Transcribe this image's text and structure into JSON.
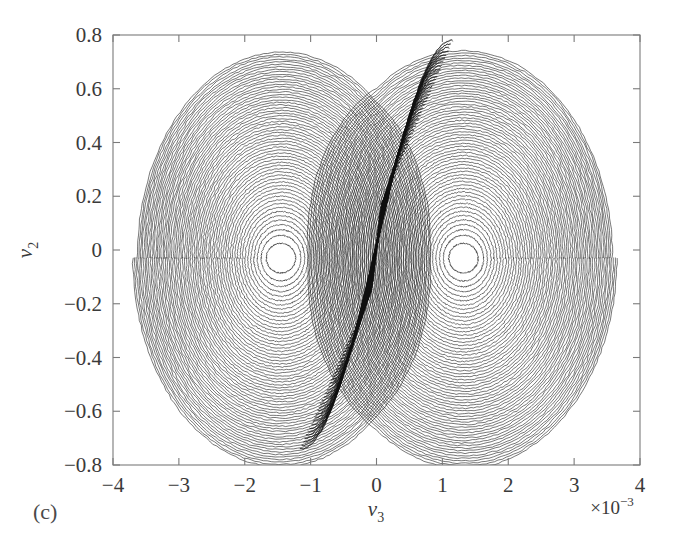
{
  "figure": {
    "panel_label": "(c)",
    "background_color": "#ffffff",
    "line_color": "#101010",
    "axis_color": "#7a7a7a"
  },
  "chart_data": {
    "type": "line",
    "title": "",
    "subtitle": "",
    "xlabel": "v3",
    "xlabel_base": "ν",
    "xlabel_sub": "3",
    "ylabel": "v2",
    "ylabel_base": "ν",
    "ylabel_sub": "2",
    "x_multiplier": "×10",
    "x_multiplier_exponent": "−3",
    "x_multiplier_full": "×10⁻³",
    "xlim": [
      -4,
      4
    ],
    "ylim": [
      -0.8,
      0.8
    ],
    "xticks": [
      -4,
      -3,
      -2,
      -1,
      0,
      1,
      2,
      3,
      4
    ],
    "xticklabels": [
      "−4",
      "−3",
      "−2",
      "−1",
      "0",
      "1",
      "2",
      "3",
      "4"
    ],
    "yticks": [
      0.8,
      0.6,
      0.4,
      0.2,
      0,
      -0.2,
      -0.4,
      -0.6,
      -0.8
    ],
    "yticklabels": [
      "0.8",
      "0.6",
      "0.4",
      "0.2",
      "0",
      "−0.2",
      "−0.4",
      "−0.6",
      "−0.8"
    ],
    "grid": false,
    "legend": "none",
    "attractor": {
      "kind": "double-scroll",
      "left_focus": [
        -1.45,
        -0.03
      ],
      "right_focus": [
        1.32,
        -0.03
      ],
      "left_lobe_x_range": [
        -3.62,
        0.15
      ],
      "right_lobe_x_range": [
        -0.15,
        3.58
      ],
      "y_range_observed": [
        -0.78,
        0.79
      ],
      "n_orbits_per_lobe": 62,
      "crossing_region_x": [
        -0.6,
        0.6
      ]
    },
    "series": [
      {
        "name": "trajectory",
        "x_units": "1e-3",
        "y_units": "1",
        "color": "#101010"
      }
    ]
  }
}
